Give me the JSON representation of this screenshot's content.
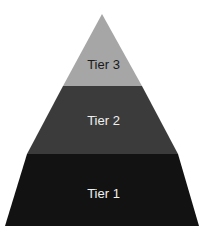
{
  "diagram": {
    "type": "pyramid",
    "tiers": [
      {
        "label": "Tier 3",
        "color": "#a6a6a6",
        "text_color": "#1a1a1a"
      },
      {
        "label": "Tier 2",
        "color": "#3b3b3b",
        "text_color": "#f0f0f0"
      },
      {
        "label": "Tier 1",
        "color": "#121212",
        "text_color": "#f0f0f0"
      }
    ]
  }
}
